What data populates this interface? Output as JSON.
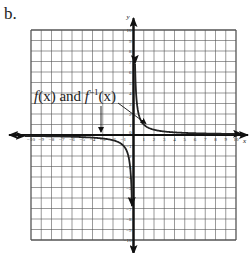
{
  "problem_label": "b.",
  "chart_data": {
    "type": "line",
    "title": "",
    "xlabel": "x",
    "ylabel": "y",
    "xlim": [
      -10,
      10
    ],
    "ylim": [
      -10,
      10
    ],
    "grid": true,
    "x_ticks": [
      -10,
      -9,
      -8,
      -7,
      -6,
      -5,
      -4,
      -3,
      -2,
      -1,
      1,
      2,
      3,
      4,
      5,
      6,
      7,
      8,
      9,
      10
    ],
    "y_ticks": [
      -10,
      -9,
      -8,
      -7,
      -6,
      -5,
      -4,
      -3,
      -2,
      -1,
      1,
      2,
      3,
      4,
      5,
      6,
      7,
      8,
      9,
      10
    ],
    "series": [
      {
        "name": "f(x) and f^-1(x)",
        "equation": "y = 1/x",
        "branches": [
          {
            "x": [
              0.1,
              0.2,
              0.5,
              1,
              2,
              4,
              6,
              8,
              10
            ],
            "y": [
              10,
              5,
              2,
              1,
              0.5,
              0.25,
              0.167,
              0.125,
              0.1
            ]
          },
          {
            "x": [
              -10,
              -8,
              -6,
              -4,
              -2,
              -1,
              -0.5,
              -0.2,
              -0.1
            ],
            "y": [
              -0.1,
              -0.125,
              -0.167,
              -0.25,
              -0.5,
              -1,
              -2,
              -5,
              -10
            ]
          }
        ],
        "color": "#222222"
      }
    ],
    "annotations": [
      {
        "text_parts": [
          "f",
          "(x) and ",
          "f",
          "−1",
          "(x)"
        ],
        "label": "f(x) and f^-1(x)"
      }
    ]
  }
}
